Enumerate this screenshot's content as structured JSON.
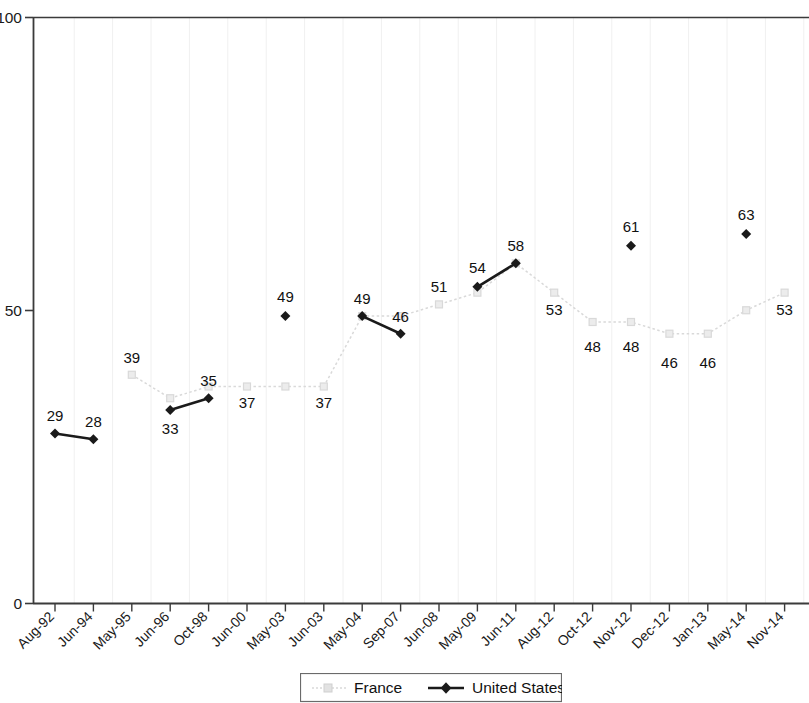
{
  "chart_data": {
    "type": "line",
    "title": "",
    "subtitle": "",
    "xlabel": "",
    "ylabel": "",
    "ylim": [
      0,
      100
    ],
    "yticks": [
      0,
      50,
      100
    ],
    "grid": "vertical-faint",
    "legend_position": "bottom-center",
    "categories": [
      "Aug-92",
      "Jun-94",
      "May-95",
      "Jun-96",
      "Oct-98",
      "Jun-00",
      "May-03",
      "Jun-03",
      "May-04",
      "Sep-07",
      "Jun-08",
      "May-09",
      "Jun-11",
      "Aug-12",
      "Oct-12",
      "Nov-12",
      "Dec-12",
      "Jan-13",
      "May-14",
      "Nov-14"
    ],
    "series": [
      {
        "name": "France",
        "color": "#d9d9d9",
        "marker": "square",
        "line_style": "dotted",
        "values": [
          null,
          null,
          39,
          35,
          37,
          37,
          37,
          37,
          49,
          49,
          51,
          53,
          58,
          53,
          48,
          48,
          46,
          46,
          50,
          53
        ],
        "labels": [
          null,
          null,
          "39",
          null,
          null,
          "37",
          null,
          "37",
          "49",
          null,
          "51",
          null,
          "58",
          "53",
          "48",
          "48",
          "46",
          "46",
          null,
          "53"
        ]
      },
      {
        "name": "United States",
        "color": "#1a1a1a",
        "marker": "diamond",
        "line_style": "solid",
        "values": [
          29,
          28,
          null,
          33,
          35,
          null,
          49,
          null,
          49,
          46,
          null,
          54,
          58,
          null,
          null,
          61,
          null,
          null,
          63,
          null
        ],
        "labels": [
          "29",
          "28",
          null,
          "33",
          "35",
          null,
          "49",
          null,
          null,
          "46",
          null,
          "54",
          null,
          null,
          null,
          "61",
          null,
          null,
          "63",
          null
        ]
      }
    ]
  },
  "axis": {
    "y_labels": [
      "100",
      "50",
      "0"
    ]
  },
  "legend": {
    "entries": [
      {
        "label": "France"
      },
      {
        "label": "United States"
      }
    ]
  },
  "data_labels": {
    "us": {
      "aug92": "29",
      "jun94": "28",
      "jun96": "33",
      "oct98": "35",
      "may03": "49",
      "sep07": "46",
      "may09": "54",
      "jun11": "58",
      "nov12": "61",
      "may14": "63"
    },
    "france": {
      "may95": "39",
      "jun00": "37",
      "jun03": "37",
      "may04": "49",
      "jun08": "51",
      "aug12": "53",
      "oct12": "48",
      "nov12": "48",
      "dec12": "46",
      "jan13": "46",
      "nov14": "53"
    }
  }
}
